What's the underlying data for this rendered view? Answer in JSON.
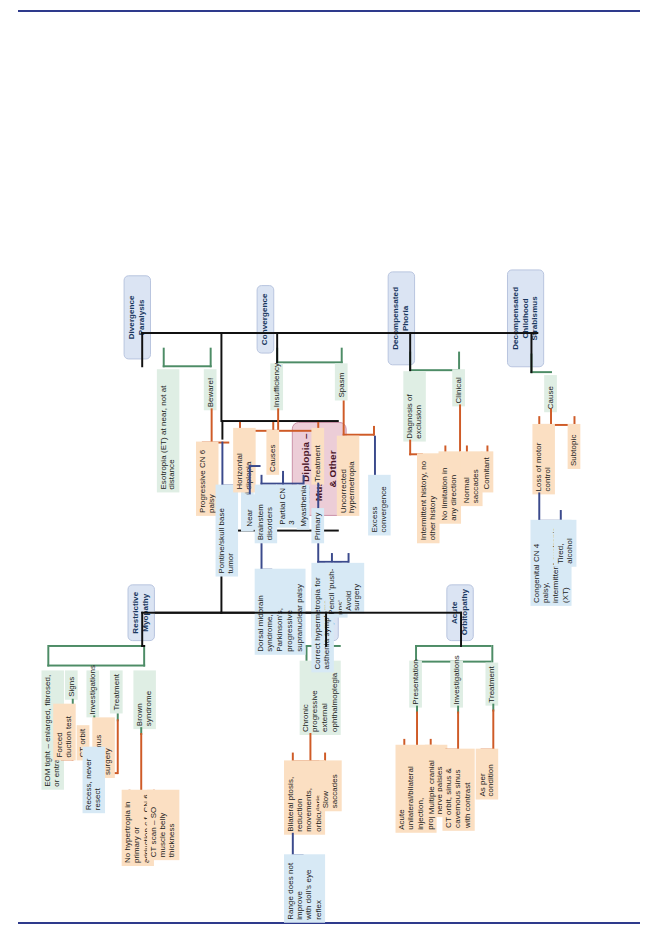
{
  "page": {
    "title": "5.28 Diplopia – Muscle, Orbit & Other",
    "accent_root": "#eccdd7",
    "accent_branch": "#dbe4f3",
    "accent_green": "#dfeee4",
    "accent_blue": "#d7e9f5",
    "accent_orange": "#fbdfc2"
  },
  "root": {
    "label": "5.28 Diplopia –\nMuscle, Orbit\n& Other"
  },
  "branches": [
    {
      "id": "restrictive-myopathy",
      "label": "Restrictive\nMyopathy",
      "nodes": {
        "eom": "EOM tight – enlarged, fibrosed, or entrapped",
        "signs": "Signs",
        "forced_duction": "Forced duction test",
        "investigations": "Investigations",
        "ct_orbit": "CT orbit",
        "treatment": "Treatment",
        "strabismus_surgery": "Strabismus surgery",
        "recess": "Recess, never resect",
        "brown_syndrome": "Brown syndrome",
        "no_hypertropia": "No hypertropia in primary or adduction c.f. CN 6",
        "ct_scan_so": "CT scan – SO muscle belly thickness"
      }
    },
    {
      "id": "paretic-myopathy",
      "label": "Paretic\nMyopathy",
      "nodes": {
        "cpeo": "Chronic progressive\nexternal ophthalmoplegia",
        "bilateral_ptosis": "Bilateral ptosis, reduction\nmovements, orbicularis",
        "slow_saccades": "Slow saccades",
        "dolls_eye": "Range does not improve\nwith doll's eye reflex"
      }
    },
    {
      "id": "acute-orbitopathy",
      "label": "Acute\nOrbitopathy",
      "nodes": {
        "presentation": "Presentation",
        "acute_unilateral": "Acute unilateral/bilateral injection,\nproptosis, diplopia",
        "multiple_cn": "Multiple cranial nerve palsies",
        "investigations": "Investigations",
        "ct_orbit_sinus": "CT orbit, sinus & cavernous sinus\nwith contrast",
        "treatment": "Treatment",
        "as_per_condition": "As per condition"
      }
    },
    {
      "id": "divergence-paralysis",
      "label": "Divergence Paralysis",
      "nodes": {
        "esotropia": "Esotropia (ET) at near, not at distance",
        "beware": "Beware!",
        "progressive_cn6": "Progressive CN 6 palsy",
        "pontine": "Pontine/skull base tumor",
        "myasthenia": "Myasthenia"
      }
    },
    {
      "id": "convergence",
      "label": "Convergence",
      "nodes": {
        "insufficiency": "Insufficiency",
        "horizontal_diplopia": "Horizontal diplopia",
        "near_only": "Near only",
        "causes": "Causes",
        "brainstem": "Brainstem disorders",
        "dorsal_midbrain": "Dorsal midbrain syndrome, Parkinson's,\nprogressive supranuclear palsy",
        "partial_cn3": "Partial CN 3",
        "myasthenia": "Myasthenia",
        "treatment": "Treatment",
        "primary": "Primary",
        "correct_hyper": "Correct hypermetropia for asthenia symptoms",
        "pencil_pushups": "Pencil 'push-ups'",
        "avoid_surgery": "Avoid surgery",
        "spasm": "Spasm",
        "uncorrected_hyper": "Uncorrected hypermetropia",
        "excess_convergence": "Excess convergence"
      }
    },
    {
      "id": "decompensated-phoria",
      "label": "Decompensated Phoria",
      "nodes": {
        "diagnosis_exclusion": "Diagnosis of exclusion",
        "intermittent": "Intermittent history, no other history",
        "clinical": "Clinical",
        "no_limitation": "No limitation in any direction",
        "normal_saccades": "Normal saccades",
        "comitant": "Comitant"
      }
    },
    {
      "id": "decompensated-childhood-strabismus",
      "label": "Decompensated\nChildhood Strabismus",
      "nodes": {
        "cause": "Cause",
        "loss_motor": "Loss of motor control",
        "congenital": "Congenital CN 4 palsy,\nintermittent exotropia (XT)",
        "subtopic": "Subtopic",
        "tired_alcohol": "Tired, alcohol"
      }
    }
  ]
}
